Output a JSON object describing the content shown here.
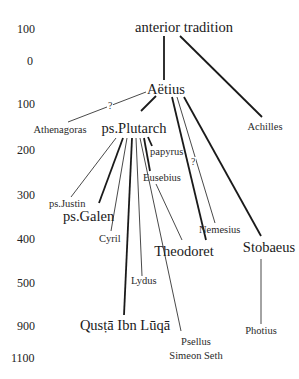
{
  "axis": {
    "ticks": [
      "100",
      "0",
      "100",
      "200",
      "300",
      "400",
      "500",
      "900",
      "1100"
    ]
  },
  "nodes": {
    "anterior_tradition": "anterior tradition",
    "aetius": "Aëtius",
    "athenagoras": "Athenagoras",
    "achilles": "Achilles",
    "ps_plutarch": "ps.Plutarch",
    "papyrus": "papyrus",
    "eusebius": "Eusebius",
    "ps_justin": "ps.Justin",
    "ps_galen": "ps.Galen",
    "cyril": "Cyril",
    "nemesius": "Nemesius",
    "theodoret": "Theodoret",
    "stobaeus": "Stobaeus",
    "lydus": "Lydus",
    "qusta": "Qusṭā Ibn Lūqā",
    "psellus": "Psellus",
    "simeon_seth": "Simeon Seth",
    "photius": "Photius"
  },
  "uncertain_marks": {
    "athenagoras_link": "?",
    "nemesius_link": "?"
  },
  "colors": {
    "line": "#1a1a1a",
    "text": "#1a1a1a",
    "background": "#ffffff"
  }
}
